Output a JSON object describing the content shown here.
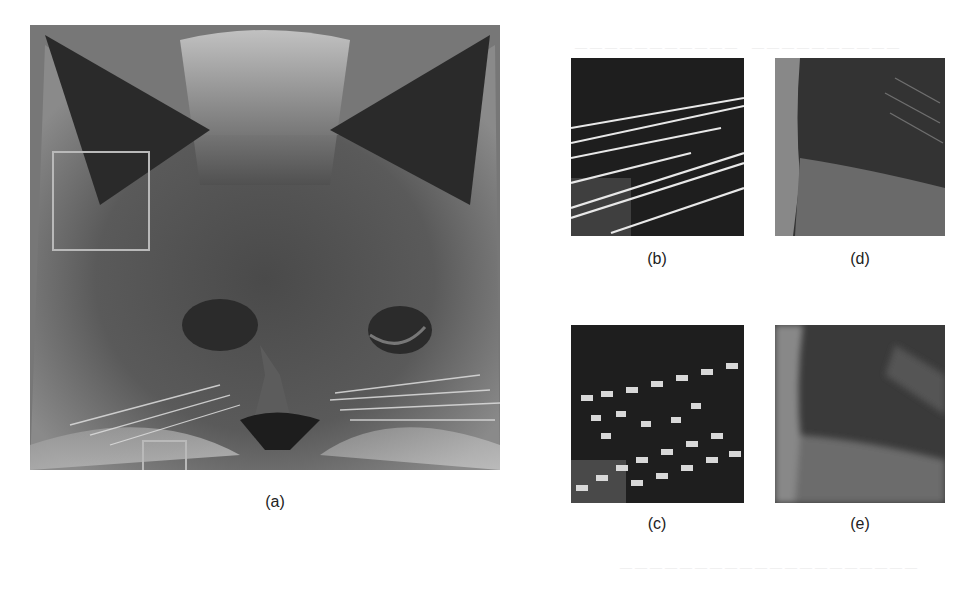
{
  "figure": {
    "panels": [
      {
        "id": "a",
        "caption": "(a)",
        "description": "Full grayscale cat face image with two highlighted regions of interest"
      },
      {
        "id": "b",
        "caption": "(b)",
        "description": "Zoomed whisker region, sharp reconstruction"
      },
      {
        "id": "c",
        "caption": "(c)",
        "description": "Zoomed whisker region, blocky pixelated reconstruction"
      },
      {
        "id": "d",
        "caption": "(d)",
        "description": "Zoomed ear/fur edge region, sharper reconstruction"
      },
      {
        "id": "e",
        "caption": "(e)",
        "description": "Zoomed ear/fur edge region, blurrier reconstruction"
      }
    ],
    "roi_boxes": [
      {
        "name": "ear-region-box",
        "color": "#b9b9b9"
      },
      {
        "name": "whisker-region-box",
        "color": "#b9b9b9"
      }
    ],
    "colors": {
      "background": "#ffffff",
      "roi_border": "#b9b9b9",
      "image_bg": "#6f6f6f"
    }
  }
}
